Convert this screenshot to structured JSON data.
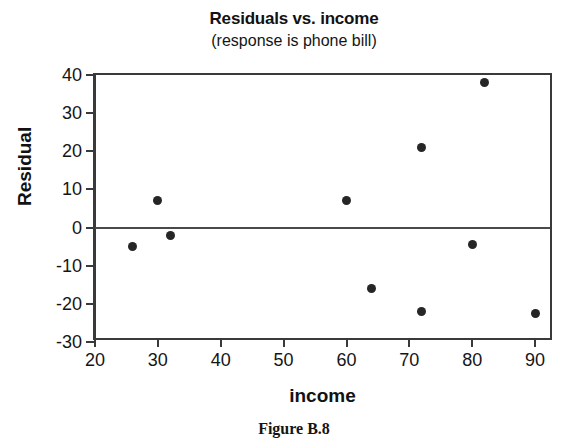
{
  "chart_data": {
    "type": "scatter",
    "title": "Residuals vs. income",
    "subtitle": "(response is phone bill)",
    "xlabel": "income",
    "ylabel": "Residual",
    "xlim": [
      20,
      93
    ],
    "ylim": [
      -30,
      40
    ],
    "xticks": [
      20,
      30,
      40,
      50,
      60,
      70,
      80,
      90
    ],
    "yticks": [
      40,
      30,
      20,
      10,
      0,
      -10,
      -20,
      -30
    ],
    "xtick_labels": [
      "20",
      "30",
      "40",
      "50",
      "60",
      "70",
      "80",
      "90"
    ],
    "ytick_labels": [
      "40",
      "30",
      "20",
      "10",
      "0",
      "-10",
      "-20",
      "-30"
    ],
    "grid": false,
    "legend": "none",
    "reference_lines": [
      {
        "name": "zero-line",
        "axis": "y",
        "value": 0
      }
    ],
    "marker": {
      "shape": "circle",
      "color": "#262626",
      "size": 9
    },
    "points": [
      {
        "x": 26,
        "y": -5
      },
      {
        "x": 30,
        "y": 7
      },
      {
        "x": 32,
        "y": -2
      },
      {
        "x": 60,
        "y": 7
      },
      {
        "x": 64,
        "y": -16
      },
      {
        "x": 72,
        "y": 21
      },
      {
        "x": 72,
        "y": -22
      },
      {
        "x": 80,
        "y": -4.5
      },
      {
        "x": 82,
        "y": 38
      },
      {
        "x": 90,
        "y": -22.5
      }
    ]
  },
  "caption": {
    "text": "Figure B.8"
  },
  "colors": {
    "frame": "#3a3a3a",
    "marker": "#262626",
    "zero_line": "#4a4a4a",
    "text": "#151515",
    "background": "#ffffff"
  }
}
